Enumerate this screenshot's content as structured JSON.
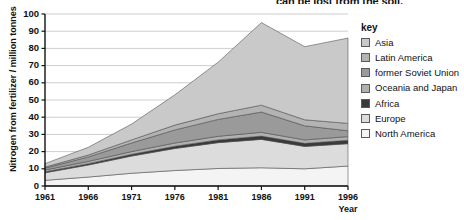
{
  "headline": {
    "text": "can be lost from the soil,"
  },
  "legend": {
    "title": "key",
    "items": [
      {
        "label": "Asia",
        "color": "#c9c9c9"
      },
      {
        "label": "Latin America",
        "color": "#b3b3b3"
      },
      {
        "label": "former Soviet Union",
        "color": "#9a9a9a"
      },
      {
        "label": "Oceania and Japan",
        "color": "#b0b0b0"
      },
      {
        "label": "Africa",
        "color": "#3a3a3a"
      },
      {
        "label": "Europe",
        "color": "#dcdcdc"
      },
      {
        "label": "North America",
        "color": "#f4f4f4"
      }
    ]
  },
  "chart_data": {
    "type": "area",
    "title": "",
    "xlabel": "Year",
    "ylabel": "Nitrogen from fertilizer / million tonnes",
    "x": [
      1961,
      1966,
      1971,
      1976,
      1981,
      1986,
      1991,
      1996
    ],
    "categories": [
      "1961",
      "1966",
      "1971",
      "1976",
      "1981",
      "1986",
      "1991",
      "1996"
    ],
    "xlim": [
      1961,
      1996
    ],
    "ylim": [
      0,
      100
    ],
    "ytick_values": [
      0,
      10,
      20,
      30,
      40,
      50,
      60,
      70,
      80,
      90,
      100
    ],
    "ytick_labels": [
      "0",
      "10",
      "20",
      "30",
      "40",
      "50",
      "60",
      "70",
      "80",
      "90",
      "100"
    ],
    "xtick_labels": [
      "1961",
      "1966",
      "1971",
      "1976",
      "1981",
      "1986",
      "1991",
      "1996"
    ],
    "grid": "horizontal",
    "stacked": true,
    "stack_order_bottom_to_top": [
      "North America",
      "Europe",
      "Africa",
      "Oceania and Japan",
      "former Soviet Union",
      "Latin America",
      "Asia"
    ],
    "legend_position": "right",
    "series": [
      {
        "name": "North America",
        "color": "#f4f4f4",
        "values": [
          3.3,
          5.2,
          7.4,
          9.0,
          10.2,
          10.6,
          10.0,
          11.6
        ]
      },
      {
        "name": "Europe",
        "color": "#dcdcdc",
        "values": [
          4.4,
          7.0,
          10.0,
          12.8,
          15.0,
          16.5,
          13.0,
          13.0
        ]
      },
      {
        "name": "Africa",
        "color": "#3a3a3a",
        "values": [
          0.6,
          0.8,
          1.0,
          1.3,
          1.6,
          1.9,
          1.8,
          2.0
        ]
      },
      {
        "name": "Oceania and Japan",
        "color": "#b0b0b0",
        "values": [
          1.0,
          1.3,
          1.6,
          1.9,
          2.1,
          2.2,
          2.0,
          2.1
        ]
      },
      {
        "name": "former Soviet Union",
        "color": "#9a9a9a",
        "values": [
          1.1,
          2.6,
          5.0,
          7.6,
          9.8,
          11.8,
          8.2,
          3.4
        ]
      },
      {
        "name": "Latin America",
        "color": "#b3b3b3",
        "values": [
          0.6,
          1.1,
          1.8,
          2.8,
          3.3,
          4.0,
          3.5,
          4.3
        ]
      },
      {
        "name": "Asia",
        "color": "#c9c9c9",
        "values": [
          2.0,
          4.5,
          9.2,
          17.6,
          30.0,
          48.0,
          42.5,
          49.6
        ]
      }
    ],
    "totals": [
      13.0,
      22.5,
      36.0,
      53.0,
      72.0,
      95.0,
      81.0,
      86.0
    ]
  }
}
